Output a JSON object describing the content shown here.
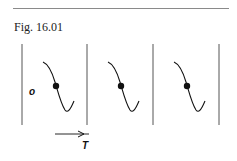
{
  "figure": {
    "caption": "Fig. 16.01",
    "panel_count": 3,
    "origin_label": "o",
    "axis_label": "T",
    "colors": {
      "ink": "#111111",
      "rule": "#8a8a8a",
      "divider": "#555555"
    }
  }
}
